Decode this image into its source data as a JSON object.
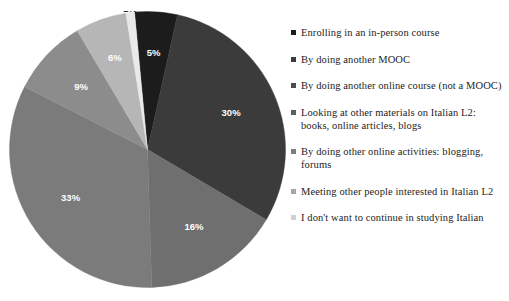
{
  "chart_data": {
    "type": "pie",
    "title": "",
    "subtitle": "",
    "legend_position": "right",
    "grid": false,
    "start_angle_deg": -5.4,
    "direction": "clockwise",
    "value_label_suffix": "%",
    "categories": [
      "Enrolling in an in-person course",
      "By doing another MOOC",
      "By doing another online course (not a MOOC)",
      "Looking at other materials on Italian L2:\nbooks, online articles, blogs",
      "By doing other online activities: blogging,\nforums",
      "Meeting other people interested in Italian L2",
      "I don't want to continue in studying Italian"
    ],
    "values": [
      5,
      30,
      16,
      33,
      9,
      6,
      1
    ],
    "value_labels": [
      "5%",
      "30%",
      "16%",
      "33%",
      "9%",
      "6%",
      "1%"
    ],
    "colors": [
      "#1c1c1c",
      "#3b3b3b",
      "#6f6f6f",
      "#7b7b7b",
      "#8c8c8c",
      "#b6b6b6",
      "#e9e9e9"
    ],
    "label_text_colors": [
      "#ffffff",
      "#ffffff",
      "#ffffff",
      "#ffffff",
      "#ffffff",
      "#ffffff",
      "#2b2b2b"
    ]
  },
  "legend": {
    "items": [
      {
        "label": "Enrolling in an in-person course",
        "color": "#1c1c1c"
      },
      {
        "label": "By doing another MOOC",
        "color": "#3b3b3b"
      },
      {
        "label": "By doing another online course (not a MOOC)",
        "color": "#4d4d4d"
      },
      {
        "label": "Looking at other materials on Italian L2:\nbooks, online articles, blogs",
        "color": "#5e5e5e"
      },
      {
        "label": "By doing other online activities: blogging,\nforums",
        "color": "#7d7d7d"
      },
      {
        "label": "Meeting other people interested in Italian L2",
        "color": "#a5a5a5"
      },
      {
        "label": "I don't want to continue in studying Italian",
        "color": "#d0d0d0"
      }
    ]
  }
}
